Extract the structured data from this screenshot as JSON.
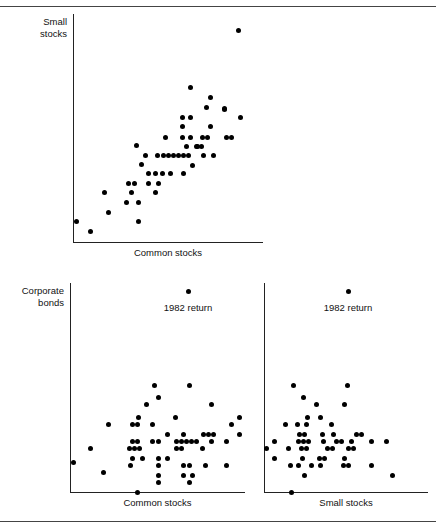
{
  "figure": {
    "background": "#ffffff",
    "dot_color": "#000000",
    "axis_color": "#222222",
    "rule_color": "#444444",
    "rules": [
      {
        "name": "top-rule",
        "y": 6
      },
      {
        "name": "bottom-rule",
        "y": 521
      }
    ]
  },
  "chart_data": [
    {
      "id": "small-vs-common",
      "type": "scatter",
      "title": "",
      "xlabel": "Common stocks",
      "ylabel": "Small stocks",
      "grid": false,
      "legend": null,
      "annotations": [],
      "plot_box": {
        "x": 73,
        "y": 14,
        "width": 190,
        "height": 229
      },
      "axis_origin": {
        "x": 73,
        "y": 243
      },
      "points": [
        [
          238,
          30
        ],
        [
          190,
          87
        ],
        [
          210,
          97
        ],
        [
          206,
          107
        ],
        [
          224,
          108
        ],
        [
          182,
          117
        ],
        [
          190,
          117
        ],
        [
          240,
          117
        ],
        [
          182,
          126
        ],
        [
          210,
          126
        ],
        [
          165,
          137
        ],
        [
          182,
          137
        ],
        [
          190,
          137
        ],
        [
          202,
          137
        ],
        [
          207,
          137
        ],
        [
          226,
          137
        ],
        [
          231,
          137
        ],
        [
          224,
          109
        ],
        [
          186,
          146
        ],
        [
          196,
          146
        ],
        [
          201,
          146
        ],
        [
          136,
          145
        ],
        [
          197,
          146
        ],
        [
          145,
          155
        ],
        [
          157,
          155
        ],
        [
          163,
          155
        ],
        [
          168,
          155
        ],
        [
          173,
          155
        ],
        [
          178,
          155
        ],
        [
          183,
          155
        ],
        [
          188,
          155
        ],
        [
          203,
          155
        ],
        [
          213,
          155
        ],
        [
          141,
          164
        ],
        [
          192,
          165
        ],
        [
          148,
          173
        ],
        [
          155,
          173
        ],
        [
          162,
          173
        ],
        [
          170,
          173
        ],
        [
          183,
          173
        ],
        [
          128,
          183
        ],
        [
          134,
          183
        ],
        [
          148,
          183
        ],
        [
          158,
          183
        ],
        [
          104,
          192
        ],
        [
          131,
          192
        ],
        [
          155,
          192
        ],
        [
          126,
          202
        ],
        [
          138,
          202
        ],
        [
          108,
          212
        ],
        [
          76,
          221
        ],
        [
          138,
          221
        ],
        [
          90,
          231
        ]
      ]
    },
    {
      "id": "corporate-vs-common",
      "type": "scatter",
      "title": "",
      "xlabel": "Common stocks",
      "ylabel": "Corporate bonds",
      "grid": false,
      "legend": null,
      "annotations": [
        {
          "text": "1982 return",
          "x": 188,
          "y": 302,
          "dot_x": 188,
          "dot_y": 289
        }
      ],
      "plot_box": {
        "x": 70,
        "y": 283,
        "width": 175,
        "height": 210
      },
      "axis_origin": {
        "x": 70,
        "y": 493
      },
      "points": [
        [
          154,
          385
        ],
        [
          189,
          385
        ],
        [
          158,
          397
        ],
        [
          146,
          404
        ],
        [
          211,
          404
        ],
        [
          138,
          417
        ],
        [
          175,
          417
        ],
        [
          239,
          417
        ],
        [
          108,
          424
        ],
        [
          132,
          424
        ],
        [
          137,
          424
        ],
        [
          152,
          424
        ],
        [
          231,
          424
        ],
        [
          167,
          434
        ],
        [
          183,
          434
        ],
        [
          203,
          434
        ],
        [
          208,
          434
        ],
        [
          213,
          434
        ],
        [
          239,
          434
        ],
        [
          132,
          441
        ],
        [
          137,
          441
        ],
        [
          152,
          441
        ],
        [
          158,
          441
        ],
        [
          176,
          441
        ],
        [
          181,
          441
        ],
        [
          186,
          441
        ],
        [
          191,
          441
        ],
        [
          196,
          441
        ],
        [
          211,
          441
        ],
        [
          226,
          441
        ],
        [
          90,
          448
        ],
        [
          129,
          448
        ],
        [
          134,
          448
        ],
        [
          139,
          448
        ],
        [
          176,
          448
        ],
        [
          181,
          448
        ],
        [
          202,
          448
        ],
        [
          132,
          458
        ],
        [
          142,
          458
        ],
        [
          158,
          458
        ],
        [
          167,
          458
        ],
        [
          73,
          462
        ],
        [
          130,
          465
        ],
        [
          158,
          465
        ],
        [
          183,
          465
        ],
        [
          189,
          465
        ],
        [
          205,
          465
        ],
        [
          226,
          465
        ],
        [
          103,
          472
        ],
        [
          158,
          475
        ],
        [
          183,
          475
        ],
        [
          192,
          475
        ],
        [
          158,
          482
        ],
        [
          189,
          482
        ],
        [
          137,
          492
        ]
      ]
    },
    {
      "id": "corporate-vs-small",
      "type": "scatter",
      "title": "",
      "xlabel": "Small stocks",
      "ylabel": "",
      "grid": false,
      "legend": null,
      "annotations": [
        {
          "text": "1982 return",
          "x": 348,
          "y": 302,
          "dot_x": 348,
          "dot_y": 289
        }
      ],
      "plot_box": {
        "x": 264,
        "y": 283,
        "width": 164,
        "height": 210
      },
      "axis_origin": {
        "x": 264,
        "y": 493
      },
      "points": [
        [
          293,
          385
        ],
        [
          347,
          385
        ],
        [
          303,
          397
        ],
        [
          316,
          404
        ],
        [
          344,
          404
        ],
        [
          307,
          417
        ],
        [
          320,
          417
        ],
        [
          285,
          424
        ],
        [
          297,
          424
        ],
        [
          306,
          424
        ],
        [
          331,
          424
        ],
        [
          299,
          434
        ],
        [
          304,
          434
        ],
        [
          322,
          434
        ],
        [
          333,
          434
        ],
        [
          356,
          434
        ],
        [
          361,
          434
        ],
        [
          274,
          441
        ],
        [
          298,
          441
        ],
        [
          303,
          441
        ],
        [
          308,
          441
        ],
        [
          323,
          441
        ],
        [
          336,
          441
        ],
        [
          341,
          441
        ],
        [
          351,
          441
        ],
        [
          371,
          441
        ],
        [
          386,
          441
        ],
        [
          266,
          448
        ],
        [
          288,
          448
        ],
        [
          301,
          448
        ],
        [
          306,
          448
        ],
        [
          327,
          448
        ],
        [
          332,
          448
        ],
        [
          348,
          448
        ],
        [
          353,
          448
        ],
        [
          274,
          458
        ],
        [
          302,
          458
        ],
        [
          319,
          458
        ],
        [
          324,
          458
        ],
        [
          344,
          458
        ],
        [
          290,
          465
        ],
        [
          298,
          465
        ],
        [
          311,
          465
        ],
        [
          320,
          465
        ],
        [
          343,
          465
        ],
        [
          348,
          465
        ],
        [
          371,
          465
        ],
        [
          304,
          475
        ],
        [
          392,
          475
        ],
        [
          291,
          492
        ]
      ]
    }
  ]
}
